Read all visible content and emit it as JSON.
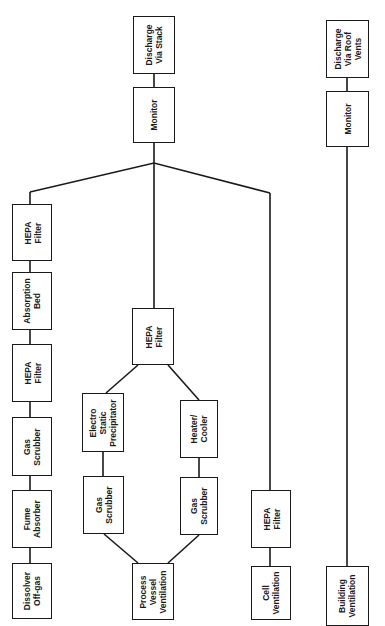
{
  "diagram": {
    "orientation": "rotated-90-ccw",
    "colors": {
      "line": "#1a1a1a",
      "background": "#ffffff"
    },
    "nodes": {
      "discharge_stack": {
        "label": "Discharge\nVia Stack"
      },
      "monitor_stack": {
        "label": "Monitor"
      },
      "discharge_roof": {
        "label": "Discharge\nVia Roof\nVents"
      },
      "monitor_roof": {
        "label": "Monitor"
      },
      "hepa_1": {
        "label": "HEPA\nFilter"
      },
      "absorption_bed": {
        "label": "Absorption\nBed"
      },
      "hepa_2": {
        "label": "HEPA\nFilter"
      },
      "gas_scrubber_offgas": {
        "label": "Gas\nScrubber"
      },
      "fume_absorber": {
        "label": "Fume\nAbsorber"
      },
      "dissolver_offgas": {
        "label": "Dissolver\nOff-gas"
      },
      "hepa_vessel": {
        "label": "HEPA\nFilter"
      },
      "esp": {
        "label": "Electro\nStatic\nPrecipitator"
      },
      "heater_cooler": {
        "label": "Heater/\nCooler"
      },
      "gas_scrubber_a": {
        "label": "Gas\nScrubber"
      },
      "gas_scrubber_b": {
        "label": "Gas\nScrubber"
      },
      "process_vessel": {
        "label": "Process\nVessel\nVentilation"
      },
      "hepa_cell": {
        "label": "HEPA\nFilter"
      },
      "cell_ventilation": {
        "label": "Cell\nVentilation"
      },
      "building_ventilation": {
        "label": "Building\nVentilation"
      }
    },
    "edges": [
      [
        "dissolver_offgas",
        "fume_absorber"
      ],
      [
        "fume_absorber",
        "gas_scrubber_offgas"
      ],
      [
        "gas_scrubber_offgas",
        "hepa_2"
      ],
      [
        "hepa_2",
        "absorption_bed"
      ],
      [
        "absorption_bed",
        "hepa_1"
      ],
      [
        "hepa_1",
        "monitor_stack"
      ],
      [
        "process_vessel",
        "gas_scrubber_a"
      ],
      [
        "process_vessel",
        "gas_scrubber_b"
      ],
      [
        "gas_scrubber_a",
        "esp"
      ],
      [
        "gas_scrubber_b",
        "heater_cooler"
      ],
      [
        "esp",
        "hepa_vessel"
      ],
      [
        "heater_cooler",
        "hepa_vessel"
      ],
      [
        "hepa_vessel",
        "monitor_stack"
      ],
      [
        "cell_ventilation",
        "hepa_cell"
      ],
      [
        "hepa_cell",
        "monitor_stack"
      ],
      [
        "monitor_stack",
        "discharge_stack"
      ],
      [
        "building_ventilation",
        "monitor_roof"
      ],
      [
        "monitor_roof",
        "discharge_roof"
      ]
    ]
  }
}
